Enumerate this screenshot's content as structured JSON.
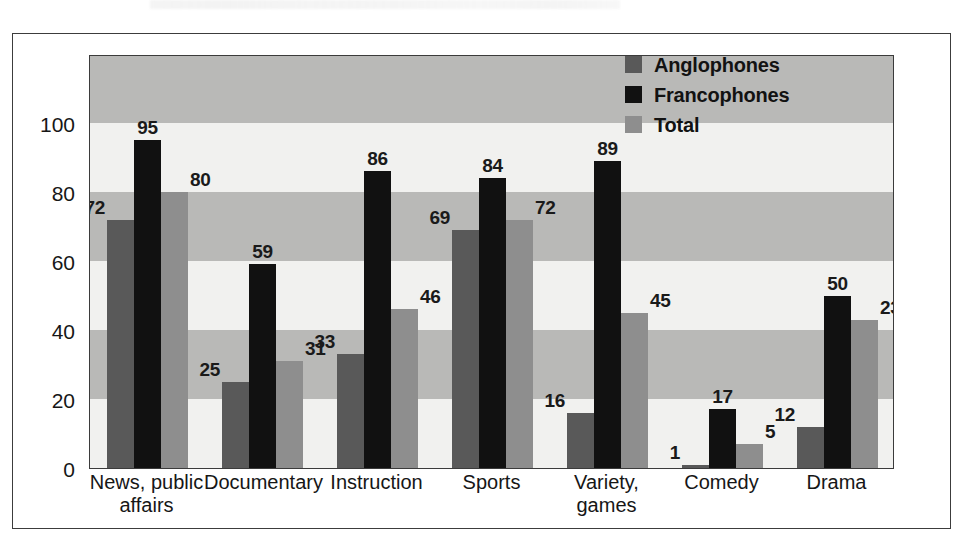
{
  "figure": {
    "background_color": "#ffffff",
    "frame_color": "#3c3c3c"
  },
  "legend": {
    "position": "top-right",
    "entries": [
      {
        "label": "Anglophones",
        "color": "#595959",
        "swatch": "legend-swatch-anglophones"
      },
      {
        "label": "Francophones",
        "color": "#111111",
        "swatch": "legend-swatch-francophones"
      },
      {
        "label": "Total",
        "color": "#8e8e8e",
        "swatch": "legend-swatch-total"
      }
    ]
  },
  "chart_data": {
    "type": "bar",
    "title": "",
    "subtitle": "",
    "xlabel": "",
    "ylabel": "",
    "ylim": [
      0,
      120
    ],
    "yticks": [
      0,
      20,
      40,
      60,
      80,
      100
    ],
    "ytick_labels": [
      "0",
      "20",
      "40",
      "60",
      "80",
      "100"
    ],
    "grid": false,
    "banded_background": true,
    "band_interval": 20,
    "band_colors": [
      "#f1f1ef",
      "#b9b9b7"
    ],
    "legend_position": "top-right",
    "categories": [
      "News, public\naffairs",
      "Documentary",
      "Instruction",
      "Sports",
      "Variety,\ngames",
      "Comedy",
      "Drama"
    ],
    "categories_flat": [
      "News, public affairs",
      "Documentary",
      "Instruction",
      "Sports",
      "Variety, games",
      "Comedy",
      "Drama"
    ],
    "series": [
      {
        "name": "Anglophones",
        "color": "#595959",
        "values": [
          72,
          25,
          33,
          69,
          16,
          1,
          12
        ],
        "label_positions": [
          "left",
          "left",
          "left",
          "left",
          "left",
          "left",
          "left"
        ]
      },
      {
        "name": "Francophones",
        "color": "#111111",
        "values": [
          95,
          59,
          86,
          84,
          89,
          17,
          50
        ],
        "label_positions": [
          "top",
          "top",
          "top",
          "top",
          "top",
          "top",
          "top"
        ]
      },
      {
        "name": "Total",
        "color": "#8e8e8e",
        "values": [
          80,
          31,
          46,
          72,
          45,
          5,
          23
        ],
        "drawn_heights": [
          80,
          31,
          46,
          72,
          45,
          7,
          43
        ],
        "label_positions": [
          "right",
          "right",
          "right",
          "right",
          "right",
          "right",
          "right"
        ]
      }
    ]
  }
}
